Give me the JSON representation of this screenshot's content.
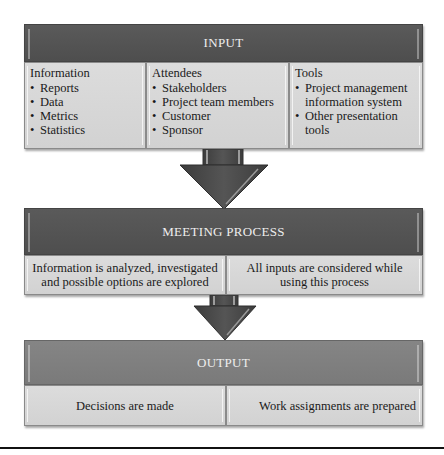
{
  "input": {
    "header": "INPUT",
    "columns": [
      {
        "title": "Information",
        "items": [
          "Reports",
          "Data",
          "Metrics",
          "Statistics"
        ]
      },
      {
        "title": "Attendees",
        "items": [
          "Stakeholders",
          "Project team members",
          "Customer",
          "Sponsor"
        ]
      },
      {
        "title": "Tools",
        "items": [
          "Project management information system",
          "Other presentation tools"
        ]
      }
    ]
  },
  "meeting_process": {
    "header": "MEETING PROCESS",
    "cells": [
      "Information is analyzed, investigated and possible options are explored",
      "All inputs are considered while using this process"
    ]
  },
  "output": {
    "header": "OUTPUT",
    "cells": [
      "Decisions are made",
      "Work assignments are prepared"
    ]
  },
  "colors": {
    "header_dark": "#525252",
    "header_light": "#7d7d7d",
    "cell_bg": "#d8d8d8",
    "arrow": "#4a4a4a"
  }
}
